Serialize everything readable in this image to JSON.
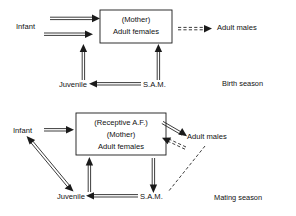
{
  "figure": {
    "title": "",
    "type": "diagram"
  },
  "panels": [
    {
      "id": "birth-season",
      "season_label": "Birth season",
      "box": {
        "lines": [
          "(Mother)",
          "Adult females"
        ]
      },
      "nodes": [
        {
          "id": "infant",
          "label": "Infant"
        },
        {
          "id": "adult-males",
          "label": "Adult males"
        },
        {
          "id": "juvenile",
          "label": "Juvenile"
        },
        {
          "id": "sam",
          "label": "S.A.M."
        }
      ],
      "edges": [
        {
          "from": "infant",
          "to": "adult-females",
          "style": "solid-double",
          "direction": "to"
        },
        {
          "from": "infant",
          "to": "adult-females",
          "style": "solid-double",
          "direction": "to"
        },
        {
          "from": "adult-females",
          "to": "adult-males",
          "style": "dashed-double",
          "direction": "to"
        },
        {
          "from": "juvenile",
          "to": "adult-females",
          "style": "solid-double",
          "direction": "up"
        },
        {
          "from": "sam",
          "to": "adult-females",
          "style": "solid-double",
          "direction": "up"
        },
        {
          "from": "sam",
          "to": "juvenile",
          "style": "solid-double",
          "direction": "to"
        }
      ]
    },
    {
      "id": "mating-season",
      "season_label": "Mating season",
      "box": {
        "lines": [
          "(Receptive A.F.)",
          "(Mother)",
          "Adult females"
        ]
      },
      "nodes": [
        {
          "id": "infant",
          "label": "Infant"
        },
        {
          "id": "adult-males",
          "label": "Adult males"
        },
        {
          "id": "juvenile",
          "label": "Juvenile"
        },
        {
          "id": "sam",
          "label": "S.A.M."
        }
      ],
      "edges": [
        {
          "from": "infant",
          "to": "adult-females",
          "style": "solid-double",
          "direction": "to"
        },
        {
          "from": "adult-females",
          "to": "adult-males",
          "style": "solid-double",
          "direction": "to"
        },
        {
          "from": "adult-males",
          "to": "adult-females",
          "style": "dashed-double",
          "direction": "to"
        },
        {
          "from": "infant",
          "to": "juvenile",
          "style": "solid-double",
          "direction": "both"
        },
        {
          "from": "juvenile",
          "to": "adult-females",
          "style": "solid-double",
          "direction": "up"
        },
        {
          "from": "adult-females",
          "to": "sam",
          "style": "solid-double",
          "direction": "down"
        },
        {
          "from": "sam",
          "to": "juvenile",
          "style": "solid-double",
          "direction": "to"
        },
        {
          "from": "adult-males",
          "to": "sam",
          "style": "dashed-single",
          "direction": "to"
        }
      ]
    }
  ],
  "colors": {
    "ink": "#1a1a1a",
    "paper": "#ffffff"
  }
}
